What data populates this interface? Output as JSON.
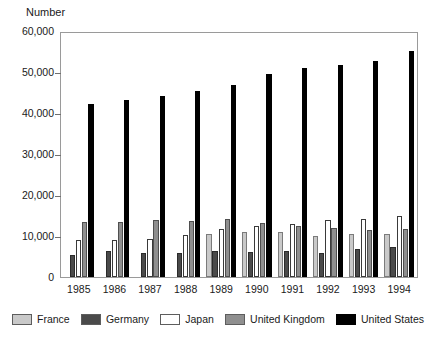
{
  "chart_data": {
    "type": "bar",
    "title": "",
    "subtitle": "",
    "xlabel": "",
    "ylabel": "Number",
    "ylim": [
      0,
      60000
    ],
    "ytick_values": [
      0,
      10000,
      20000,
      30000,
      40000,
      50000,
      60000
    ],
    "ytick_labels": [
      "0",
      "10,000",
      "20,000",
      "30,000",
      "40,000",
      "50,000",
      "60,000"
    ],
    "grid": false,
    "legend_position": "bottom",
    "categories": [
      "1985",
      "1986",
      "1987",
      "1988",
      "1989",
      "1990",
      "1991",
      "1992",
      "1993",
      "1994"
    ],
    "series": [
      {
        "name": "France",
        "color": "#c9c9c9",
        "values": [
          0,
          0,
          0,
          0,
          10500,
          11000,
          11000,
          10000,
          10500,
          10500
        ]
      },
      {
        "name": "Germany",
        "color": "#4a4a4a",
        "values": [
          5500,
          6300,
          6000,
          6000,
          6500,
          6200,
          6300,
          6000,
          7000,
          7500
        ]
      },
      {
        "name": "Japan",
        "color": "#ffffff",
        "values": [
          9000,
          9200,
          9300,
          10300,
          11800,
          12500,
          13000,
          14000,
          14300,
          15000
        ]
      },
      {
        "name": "United Kingdom",
        "color": "#8f8f8f",
        "values": [
          13500,
          13500,
          14000,
          13800,
          14200,
          13300,
          12500,
          12000,
          11500,
          11700
        ]
      },
      {
        "name": "United States",
        "color": "#000000",
        "values": [
          42500,
          43500,
          44500,
          45800,
          47300,
          50000,
          51500,
          52200,
          53000,
          55500
        ]
      }
    ]
  }
}
